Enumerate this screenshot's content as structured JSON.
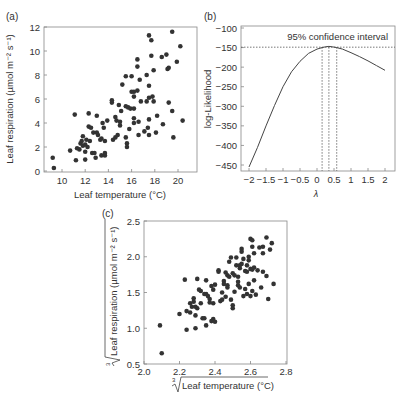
{
  "chart_data": [
    {
      "panel": "(a)",
      "type": "scatter",
      "title": "",
      "xlabel": "Leaf temperature (°C)",
      "ylabel": "Leaf respiration (µmol m⁻² s⁻¹)",
      "xlim": [
        8.5,
        21.5
      ],
      "ylim": [
        0,
        12
      ],
      "xticks": [
        10,
        12,
        14,
        16,
        18,
        20
      ],
      "yticks": [
        0,
        2,
        4,
        6,
        8,
        10,
        12
      ],
      "grid": false,
      "points": [
        [
          9.2,
          1.1
        ],
        [
          9.3,
          0.25
        ],
        [
          10.7,
          1.7
        ],
        [
          11.1,
          4.7
        ],
        [
          11.2,
          0.9
        ],
        [
          11.3,
          1.9
        ],
        [
          11.5,
          1.8
        ],
        [
          11.6,
          2.3
        ],
        [
          11.7,
          2.5
        ],
        [
          11.8,
          2.9
        ],
        [
          11.8,
          2.1
        ],
        [
          12.0,
          2.2
        ],
        [
          12.0,
          1.6
        ],
        [
          12.0,
          0.95
        ],
        [
          12.1,
          2.6
        ],
        [
          12.2,
          2.0
        ],
        [
          12.3,
          4.8
        ],
        [
          12.3,
          3.7
        ],
        [
          12.4,
          2.5
        ],
        [
          12.5,
          3.6
        ],
        [
          12.6,
          1.5
        ],
        [
          12.7,
          3.2
        ],
        [
          12.8,
          1.5
        ],
        [
          12.9,
          1.1
        ],
        [
          13.0,
          4.6
        ],
        [
          13.0,
          3.2
        ],
        [
          13.1,
          3.0
        ],
        [
          13.3,
          2.6
        ],
        [
          13.4,
          2.7
        ],
        [
          13.4,
          1.3
        ],
        [
          13.5,
          4.0
        ],
        [
          13.6,
          3.6
        ],
        [
          13.7,
          2.5
        ],
        [
          13.7,
          1.5
        ],
        [
          13.7,
          1.3
        ],
        [
          13.9,
          4.2
        ],
        [
          14.3,
          5.9
        ],
        [
          14.3,
          5.7
        ],
        [
          14.4,
          2.6
        ],
        [
          14.6,
          2.8
        ],
        [
          14.6,
          4.5
        ],
        [
          14.7,
          4.2
        ],
        [
          14.8,
          3.0
        ],
        [
          14.9,
          5.5
        ],
        [
          15.0,
          4.1
        ],
        [
          15.0,
          3.8
        ],
        [
          15.1,
          5.0
        ],
        [
          15.2,
          7.2
        ],
        [
          15.5,
          7.9
        ],
        [
          15.5,
          5.4
        ],
        [
          15.5,
          2.8
        ],
        [
          15.6,
          2.3
        ],
        [
          15.6,
          2.0
        ],
        [
          15.7,
          5.3
        ],
        [
          15.8,
          3.5
        ],
        [
          15.9,
          5.2
        ],
        [
          16.0,
          7.9
        ],
        [
          16.0,
          6.6
        ],
        [
          16.2,
          6.6
        ],
        [
          16.2,
          6.2
        ],
        [
          16.2,
          5.2
        ],
        [
          16.2,
          4.4
        ],
        [
          16.2,
          4.0
        ],
        [
          16.5,
          9.3
        ],
        [
          16.5,
          8.7
        ],
        [
          16.5,
          6.7
        ],
        [
          16.6,
          4.1
        ],
        [
          16.6,
          3.0
        ],
        [
          16.7,
          7.6
        ],
        [
          16.8,
          5.8
        ],
        [
          17.1,
          3.3
        ],
        [
          17.3,
          5.8
        ],
        [
          17.3,
          8.0
        ],
        [
          17.4,
          3.6
        ],
        [
          17.5,
          11.3
        ],
        [
          17.5,
          7.1
        ],
        [
          17.5,
          6.1
        ],
        [
          17.5,
          4.3
        ],
        [
          17.5,
          3.0
        ],
        [
          17.7,
          10.9
        ],
        [
          17.7,
          9.6
        ],
        [
          17.8,
          6.2
        ],
        [
          17.9,
          8.4
        ],
        [
          17.9,
          5.8
        ],
        [
          18.1,
          3.2
        ],
        [
          18.2,
          4.6
        ],
        [
          18.6,
          9.5
        ],
        [
          18.7,
          3.9
        ],
        [
          19.0,
          9.7
        ],
        [
          19.1,
          8.5
        ],
        [
          19.2,
          8.6
        ],
        [
          19.2,
          5.7
        ],
        [
          19.5,
          11.6
        ],
        [
          19.5,
          5.0
        ],
        [
          19.6,
          2.8
        ],
        [
          19.9,
          9.1
        ],
        [
          20.2,
          10.4
        ],
        [
          20.4,
          4.2
        ]
      ]
    },
    {
      "panel": "(b)",
      "type": "line",
      "title": "",
      "xlabel": "λ",
      "ylabel": "log-Likelihood",
      "xlim": [
        -2.25,
        2.25
      ],
      "ylim": [
        -460,
        -100
      ],
      "xticks": [
        -2,
        -1.5,
        -1,
        -0.5,
        0,
        0.5,
        1,
        1.5,
        2
      ],
      "xtick_labels": [
        "−2",
        "−1.5",
        "−1",
        "−0.5",
        "0",
        "0.5",
        "1",
        "1.5",
        "2"
      ],
      "yticks": [
        -100,
        -150,
        -200,
        -250,
        -300,
        -350,
        -400,
        -450
      ],
      "ytick_labels": [
        "−100",
        "−150",
        "−200",
        "−250",
        "−300",
        "−350",
        "−400",
        "−450"
      ],
      "grid": false,
      "annotation": "95% confidence interval",
      "ci_level": -149,
      "ci_lines_x": [
        0.15,
        0.35,
        0.58
      ],
      "x": [
        -2.0,
        -1.75,
        -1.5,
        -1.25,
        -1.0,
        -0.75,
        -0.5,
        -0.25,
        0.0,
        0.15,
        0.25,
        0.35,
        0.45,
        0.58,
        0.75,
        1.0,
        1.25,
        1.5,
        1.75,
        2.0
      ],
      "y": [
        -455,
        -405,
        -350,
        -298,
        -250,
        -212,
        -185,
        -165,
        -154,
        -150,
        -148,
        -147,
        -148,
        -150,
        -154,
        -163,
        -173,
        -184,
        -196,
        -208
      ]
    },
    {
      "panel": "(c)",
      "type": "scatter",
      "title": "",
      "xlabel": "∛Leaf temperature (°C)",
      "ylabel": "∛Leaf respiration (µmol m⁻² s⁻¹)",
      "xlim": [
        2.0,
        2.8
      ],
      "ylim": [
        0.5,
        2.5
      ],
      "xticks": [
        2.0,
        2.2,
        2.4,
        2.6,
        2.8
      ],
      "xtick_labels": [
        "2.0",
        "2.2",
        "2.4",
        "2.6",
        "2.8"
      ],
      "yticks": [
        0.5,
        1.0,
        1.5,
        2.0,
        2.5
      ],
      "ytick_labels": [
        "0.5",
        "1.0",
        "1.5",
        "2.0",
        "2.5"
      ],
      "grid": false,
      "points": [
        [
          2.09,
          1.04
        ],
        [
          2.1,
          0.65
        ],
        [
          2.2,
          1.2
        ],
        [
          2.23,
          1.68
        ],
        [
          2.24,
          1.24
        ],
        [
          2.24,
          0.98
        ],
        [
          2.26,
          1.22
        ],
        [
          2.26,
          1.35
        ],
        [
          2.27,
          1.3
        ],
        [
          2.28,
          1.42
        ],
        [
          2.28,
          1.37
        ],
        [
          2.29,
          1.3
        ],
        [
          2.29,
          1.18
        ],
        [
          2.29,
          1.0
        ],
        [
          2.3,
          1.28
        ],
        [
          2.3,
          1.69
        ],
        [
          2.31,
          1.54
        ],
        [
          2.32,
          1.52
        ],
        [
          2.32,
          1.35
        ],
        [
          2.33,
          1.14
        ],
        [
          2.34,
          1.48
        ],
        [
          2.34,
          1.14
        ],
        [
          2.35,
          1.04
        ],
        [
          2.35,
          1.48
        ],
        [
          2.35,
          1.67
        ],
        [
          2.36,
          1.45
        ],
        [
          2.37,
          1.41
        ],
        [
          2.37,
          1.36
        ],
        [
          2.38,
          1.59
        ],
        [
          2.38,
          1.1
        ],
        [
          2.39,
          1.54
        ],
        [
          2.39,
          1.35
        ],
        [
          2.39,
          1.13
        ],
        [
          2.4,
          1.09
        ],
        [
          2.4,
          1.61
        ],
        [
          2.42,
          1.81
        ],
        [
          2.42,
          1.79
        ],
        [
          2.43,
          1.38
        ],
        [
          2.44,
          1.5
        ],
        [
          2.44,
          1.4
        ],
        [
          2.45,
          1.66
        ],
        [
          2.45,
          1.62
        ],
        [
          2.46,
          1.78
        ],
        [
          2.46,
          1.44
        ],
        [
          2.47,
          1.74
        ],
        [
          2.47,
          1.6
        ],
        [
          2.47,
          1.57
        ],
        [
          2.48,
          1.72
        ],
        [
          2.48,
          1.93
        ],
        [
          2.49,
          1.99
        ],
        [
          2.49,
          1.4
        ],
        [
          2.5,
          1.77
        ],
        [
          2.5,
          1.32
        ],
        [
          2.5,
          1.28
        ],
        [
          2.51,
          1.51
        ],
        [
          2.51,
          1.74
        ],
        [
          2.52,
          1.88
        ],
        [
          2.52,
          1.99
        ],
        [
          2.53,
          1.72
        ],
        [
          2.53,
          1.65
        ],
        [
          2.53,
          1.6
        ],
        [
          2.54,
          1.88
        ],
        [
          2.54,
          1.84
        ],
        [
          2.54,
          1.57
        ],
        [
          2.55,
          2.11
        ],
        [
          2.55,
          2.07
        ],
        [
          2.55,
          1.9
        ],
        [
          2.56,
          1.97
        ],
        [
          2.56,
          1.45
        ],
        [
          2.57,
          1.8
        ],
        [
          2.57,
          1.55
        ],
        [
          2.58,
          1.88
        ],
        [
          2.58,
          1.48
        ],
        [
          2.58,
          1.79
        ],
        [
          2.59,
          2.0
        ],
        [
          2.59,
          1.95
        ],
        [
          2.59,
          1.62
        ],
        [
          2.6,
          2.25
        ],
        [
          2.6,
          1.83
        ],
        [
          2.6,
          1.45
        ],
        [
          2.61,
          2.23
        ],
        [
          2.61,
          2.14
        ],
        [
          2.61,
          1.82
        ],
        [
          2.61,
          1.52
        ],
        [
          2.62,
          2.05
        ],
        [
          2.62,
          1.85
        ],
        [
          2.62,
          1.67
        ],
        [
          2.63,
          1.47
        ],
        [
          2.64,
          1.81
        ],
        [
          2.65,
          2.13
        ],
        [
          2.66,
          1.57
        ],
        [
          2.67,
          2.14
        ],
        [
          2.67,
          2.05
        ],
        [
          2.67,
          1.79
        ],
        [
          2.69,
          2.27
        ],
        [
          2.69,
          1.73
        ],
        [
          2.7,
          1.41
        ],
        [
          2.71,
          2.1
        ],
        [
          2.72,
          2.19
        ],
        [
          2.73,
          1.62
        ]
      ]
    }
  ],
  "labels": {
    "panel_a": "(a)",
    "panel_b": "(b)",
    "panel_c": "(c)"
  }
}
